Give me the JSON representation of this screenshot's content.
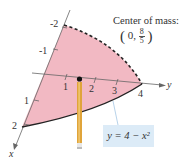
{
  "annotation": {
    "title": "Center of mass:",
    "coord_x": "0,",
    "coord_num": "8",
    "coord_den": "5",
    "open_paren": "(",
    "close_paren": ")"
  },
  "equation_label": "y = 4 − x²",
  "axes": {
    "x_label": "x",
    "y_label": "y",
    "x_ticks": [
      "-2",
      "-1",
      "1",
      "2"
    ],
    "y_ticks": [
      "1",
      "2",
      "3",
      "4"
    ]
  },
  "colors": {
    "region_fill": "#f2b9c3",
    "curve": "#222222",
    "pencil": "#e0a43a",
    "label_bg": "#dcebf7"
  }
}
